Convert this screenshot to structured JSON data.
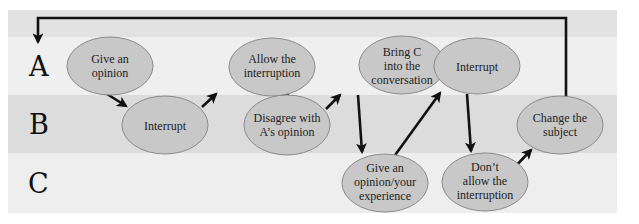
{
  "diagram": {
    "type": "flow / swimlane",
    "colors": {
      "top_strip": "#e2e2e2",
      "band_a": "#efefef",
      "band_b": "#dcdcdc",
      "band_c": "#eeeeee",
      "node_fill": "#c8c8c8",
      "node_stroke": "#8a8a8a",
      "arrow": "#111111"
    },
    "bands": [
      {
        "id": "A",
        "label": "A"
      },
      {
        "id": "B",
        "label": "B"
      },
      {
        "id": "C",
        "label": "C"
      }
    ],
    "nodes": [
      {
        "id": "n1",
        "band": "A",
        "lines": [
          "Give an",
          "opinion"
        ]
      },
      {
        "id": "n2",
        "band": "B",
        "lines": [
          "Interrupt"
        ]
      },
      {
        "id": "n3",
        "band": "A",
        "lines": [
          "Allow the",
          "interruption"
        ]
      },
      {
        "id": "n4",
        "band": "B",
        "lines": [
          "Disagree with",
          "A’s opinion"
        ]
      },
      {
        "id": "n5",
        "band": "A",
        "lines": [
          "Bring C",
          "into the",
          "conversation"
        ]
      },
      {
        "id": "n6",
        "band": "C",
        "lines": [
          "Give an",
          "opinion/your",
          "experience"
        ]
      },
      {
        "id": "n7",
        "band": "A",
        "lines": [
          "Interrupt"
        ]
      },
      {
        "id": "n8",
        "band": "C",
        "lines": [
          "Don’t",
          "allow the",
          "interruption"
        ]
      },
      {
        "id": "n9",
        "band": "B",
        "lines": [
          "Change the",
          "subject"
        ]
      }
    ],
    "edges": [
      {
        "from": "n1",
        "to": "n2"
      },
      {
        "from": "n2",
        "to": "n3"
      },
      {
        "from": "n3",
        "to": "n4"
      },
      {
        "from": "n4",
        "to": "n5"
      },
      {
        "from": "n5",
        "to": "n6"
      },
      {
        "from": "n6",
        "to": "n7"
      },
      {
        "from": "n7",
        "to": "n8"
      },
      {
        "from": "n8",
        "to": "n9"
      },
      {
        "from": "n9",
        "to": "A",
        "note": "loop back to start of band A"
      }
    ]
  }
}
